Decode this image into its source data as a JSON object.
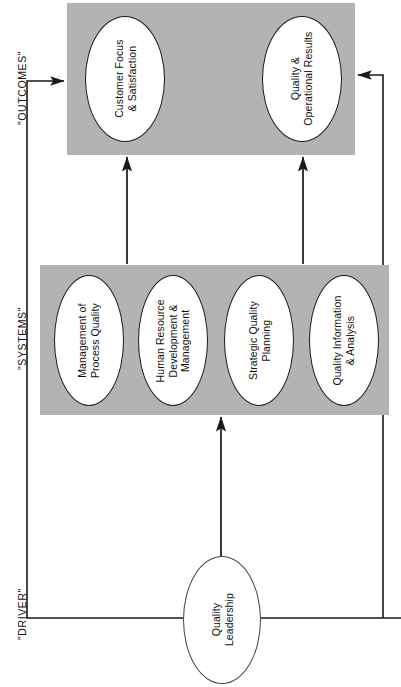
{
  "diagram": {
    "orientation": "rotated-90-ccw",
    "colors": {
      "band_fill": "#b3b3b3",
      "node_fill": "#ffffff",
      "stroke": "#1a1a1a",
      "background": "#ffffff"
    },
    "zone_labels": [
      {
        "id": "outcomes",
        "text": "\"OUTCOMES\""
      },
      {
        "id": "systems",
        "text": "\"SYSTEMS\""
      },
      {
        "id": "driver",
        "text": "\"DRIVER\""
      }
    ],
    "bands": [
      {
        "id": "outcomes-band",
        "zone": "\"OUTCOMES\""
      },
      {
        "id": "systems-band",
        "zone": "\"SYSTEMS\""
      }
    ],
    "nodes": [
      {
        "id": "customer-focus-satisfaction",
        "zone": "outcomes",
        "lines": [
          "Customer Focus",
          "& Satisfaction"
        ]
      },
      {
        "id": "quality-operational-results",
        "zone": "outcomes",
        "lines": [
          "Quality &",
          "Operational Results"
        ]
      },
      {
        "id": "management-of-process-quality",
        "zone": "systems",
        "lines": [
          "Management of",
          "Process Quality"
        ]
      },
      {
        "id": "human-resource-development-management",
        "zone": "systems",
        "lines": [
          "Human Resource",
          "Development &",
          "Management"
        ]
      },
      {
        "id": "strategic-quality-planning",
        "zone": "systems",
        "lines": [
          "Strategic Quality",
          "Planning"
        ]
      },
      {
        "id": "quality-information-analysis",
        "zone": "systems",
        "lines": [
          "Quality Information",
          "& Analysis"
        ]
      },
      {
        "id": "quality-leadership",
        "zone": "driver",
        "lines": [
          "Quality",
          "Leadership"
        ]
      }
    ],
    "connectors": [
      {
        "id": "systems-to-customer-focus",
        "from": "systems-band",
        "to": "customer-focus-satisfaction",
        "arrow": "up"
      },
      {
        "id": "systems-to-quality-results",
        "from": "systems-band",
        "to": "quality-operational-results",
        "arrow": "up"
      },
      {
        "id": "leadership-to-systems",
        "from": "quality-leadership",
        "to": "systems-band",
        "arrow": "up"
      },
      {
        "id": "leadership-left-feedback-to-outcomes",
        "from": "quality-leadership",
        "to": "outcomes-band",
        "arrow": "right"
      },
      {
        "id": "leadership-right-feedback-to-outcomes",
        "from": "quality-leadership",
        "to": "outcomes-band",
        "arrow": "left"
      }
    ]
  }
}
